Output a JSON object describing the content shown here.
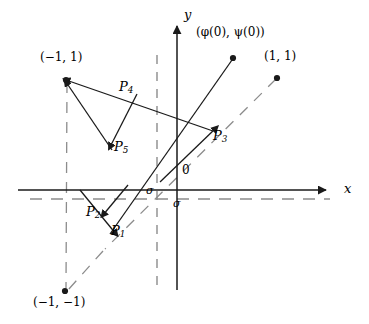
{
  "figure": {
    "type": "vector-field-phase-diagram",
    "width": 369,
    "height": 324,
    "background": "#ffffff",
    "stroke": "#1a1a1a",
    "dash_stroke": "#8c8c8c"
  },
  "axes": {
    "x_label": "x",
    "y_label": "y",
    "origin_label": "0",
    "x_axis": {
      "x1": 18,
      "y1": 190,
      "x2": 332,
      "y2": 190
    },
    "y_axis": {
      "x1": 177,
      "y1": 290,
      "x2": 177,
      "y2": 22
    },
    "x_label_pos": {
      "x": 345,
      "y": 184
    },
    "y_label_pos": {
      "x": 185,
      "y": 10
    },
    "origin_label_pos": {
      "x": 182,
      "y": 170
    }
  },
  "sigma_lines": {
    "label": "σ",
    "vertical_dashed": {
      "x": 157,
      "y1": 55,
      "y2": 292
    },
    "horizontal_dashed": {
      "y": 199,
      "x1": 30,
      "x2": 330
    },
    "label_upper_pos": {
      "x": 148,
      "y": 186
    },
    "label_lower_pos": {
      "x": 174,
      "y": 198
    }
  },
  "points": [
    {
      "name": "phi-psi-zero",
      "label": "(φ(0), ψ(0))",
      "x": 233,
      "y": 58,
      "label_x": 196,
      "label_y": 33,
      "dot": true
    },
    {
      "name": "one-one",
      "label": "(1, 1)",
      "x": 277,
      "y": 78,
      "label_x": 265,
      "label_y": 56,
      "dot": true
    },
    {
      "name": "neg-one-one",
      "label": "(−1, 1)",
      "x": 66,
      "y": 79,
      "label_x": 41,
      "label_y": 57,
      "dot": true
    },
    {
      "name": "neg-one-neg-one",
      "label": "(−1, −1)",
      "x": 65,
      "y": 292,
      "label_x": 36,
      "label_y": 298,
      "dot": true
    }
  ],
  "p_labels": [
    {
      "name": "P1",
      "base": "P",
      "sub": "1",
      "x": 115,
      "y": 231
    },
    {
      "name": "P2",
      "base": "P",
      "sub": "2",
      "x": 90,
      "y": 212
    },
    {
      "name": "P3",
      "base": "P",
      "sub": "3",
      "x": 216,
      "y": 136
    },
    {
      "name": "P4",
      "base": "P",
      "sub": "4",
      "x": 122,
      "y": 87
    },
    {
      "name": "P5",
      "base": "P",
      "sub": "5",
      "x": 116,
      "y": 146
    }
  ],
  "vectors": [
    {
      "name": "vector-p1",
      "x1": 82,
      "y1": 190,
      "x2": 113,
      "y2": 229,
      "arrow": "end"
    },
    {
      "name": "vector-p2",
      "x1": 126,
      "y1": 186,
      "x2": 104,
      "y2": 213,
      "arrow": "end"
    },
    {
      "name": "vector-p3",
      "x1": 158,
      "y1": 180,
      "x2": 213,
      "y2": 131,
      "arrow": "end"
    },
    {
      "name": "vector-p4",
      "x1": 208,
      "y1": 130,
      "x2": 68,
      "y2": 81,
      "arrow": "end"
    },
    {
      "name": "vector-p5",
      "x1": 135,
      "y1": 96,
      "x2": 111,
      "y2": 143,
      "arrow": "end"
    },
    {
      "name": "vector-to-neg-one-one",
      "x1": 110,
      "y1": 147,
      "x2": 67,
      "y2": 83,
      "arrow": "end"
    }
  ],
  "trajectories": [
    {
      "name": "traj-from-phi-psi",
      "x1": 233,
      "y1": 59,
      "x2": 111,
      "y2": 233
    },
    {
      "name": "traj-from-p1-up",
      "x1": 113,
      "y1": 231,
      "x2": 235,
      "y2": 60
    }
  ],
  "dashed_trajectories": [
    {
      "name": "dashed-from-one-one",
      "x1": 276,
      "y1": 79,
      "x2": 105,
      "y2": 249
    },
    {
      "name": "dashed-from-neg-one-one",
      "x1": 66,
      "y1": 82,
      "x2": 66,
      "y2": 290
    },
    {
      "name": "dashed-to-neg-one-neg-one",
      "x1": 102,
      "y1": 252,
      "x2": 67,
      "y2": 291
    }
  ]
}
